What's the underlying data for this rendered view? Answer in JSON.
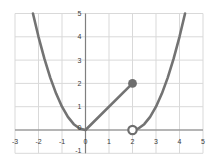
{
  "chart_data": {
    "type": "line",
    "title": "",
    "x_axis": {
      "min": -3,
      "max": 5,
      "ticks": [
        -3,
        -2,
        -1,
        0,
        1,
        2,
        3,
        4,
        5
      ]
    },
    "y_axis": {
      "min": -1,
      "max": 5,
      "ticks": [
        5,
        4,
        3,
        2,
        1,
        0,
        -1
      ]
    },
    "grid": true,
    "legend": false,
    "series": [
      {
        "name": "left-parabola",
        "formula": "y = x^2, x <= 0",
        "points": [
          [
            -2.236,
            5
          ],
          [
            -2,
            4
          ],
          [
            -1.75,
            3.0625
          ],
          [
            -1.5,
            2.25
          ],
          [
            -1.25,
            1.5625
          ],
          [
            -1,
            1
          ],
          [
            -0.75,
            0.5625
          ],
          [
            -0.5,
            0.25
          ],
          [
            -0.25,
            0.0625
          ],
          [
            0,
            0
          ]
        ]
      },
      {
        "name": "middle-line",
        "formula": "y = x, 0 <= x <= 2",
        "points": [
          [
            0,
            0
          ],
          [
            2,
            2
          ]
        ]
      },
      {
        "name": "right-parabola",
        "formula": "y = (x-2)^2, x >= 2",
        "points": [
          [
            2,
            0
          ],
          [
            2.25,
            0.0625
          ],
          [
            2.5,
            0.25
          ],
          [
            2.75,
            0.5625
          ],
          [
            3,
            1
          ],
          [
            3.25,
            1.5625
          ],
          [
            3.5,
            2.25
          ],
          [
            3.75,
            3.0625
          ],
          [
            4,
            4
          ],
          [
            4.236,
            5
          ]
        ]
      }
    ],
    "markers": [
      {
        "x": 2,
        "y": 2,
        "style": "closed"
      },
      {
        "x": 2,
        "y": 0,
        "style": "open"
      }
    ],
    "colors": {
      "curve": "#737373",
      "marker": "#6e6e6e",
      "grid": "#d9d9d9",
      "axis": "#7f7f7f",
      "tick_label": "#3a3a3a",
      "background": "#ffffff"
    }
  }
}
